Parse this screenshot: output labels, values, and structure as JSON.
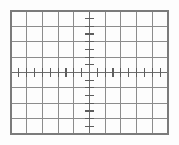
{
  "figure": {
    "name": "oscilloscope-graticule",
    "title": "",
    "background_color": "#fdfdfd"
  },
  "chart_data": {
    "type": "table",
    "title": "",
    "subtitle": "",
    "xlabel": "",
    "ylabel": "",
    "grid": "on",
    "legend": "none",
    "annotations": [],
    "series": [],
    "categories": [],
    "values": [],
    "x": [],
    "xlim": [
      -5,
      5
    ],
    "ylim": [
      -4,
      4
    ],
    "divisions_x": 10,
    "divisions_y": 8,
    "minor_ticks_per_division": 2,
    "x_tick_labels": [],
    "y_tick_labels": []
  },
  "geometry": {
    "plot_left": 11,
    "plot_top": 11,
    "plot_right": 168,
    "plot_bottom": 134,
    "center_x": 89.5,
    "center_y": 72.5,
    "cell_width": 15.7,
    "cell_height": 15.375,
    "minor_step_x": 7.85,
    "minor_step_y": 7.6875
  },
  "style": {
    "border_color": "#7b7b7b",
    "grid_color": "#8c8c8c",
    "axis_color": "#6e6e6e",
    "tick_color": "#5e5e5e",
    "border_width": 1.3,
    "grid_width": 1.15,
    "axis_width": 1.3,
    "tick_width": 1.15,
    "x_tick_half_length": 4.2,
    "y_tick_half_length": 4.6
  }
}
